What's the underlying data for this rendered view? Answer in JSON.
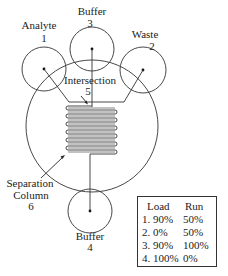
{
  "diagram": {
    "type": "microfluidic-chip-schematic",
    "stroke_color": "#333333",
    "background_color": "#ffffff",
    "reservoirs": [
      {
        "id": 1,
        "name": "Analyte",
        "number": "1"
      },
      {
        "id": 2,
        "name": "Waste",
        "number": "2"
      },
      {
        "id": 3,
        "name": "Buffer",
        "number": "3"
      },
      {
        "id": 4,
        "name": "Buffer",
        "number": "4"
      }
    ],
    "intersection": {
      "name": "Intersection",
      "number": "5"
    },
    "separation_column": {
      "line1": "Separation",
      "line2": "Column",
      "number": "6"
    }
  },
  "voltage_table": {
    "headers": {
      "load": "Load",
      "run": "Run"
    },
    "rows": [
      {
        "load": "1. 90%",
        "run": "50%"
      },
      {
        "load": "2. 0%",
        "run": "50%"
      },
      {
        "load": "3. 90%",
        "run": "100%"
      },
      {
        "load": "4. 100%",
        "run": "0%"
      }
    ]
  }
}
